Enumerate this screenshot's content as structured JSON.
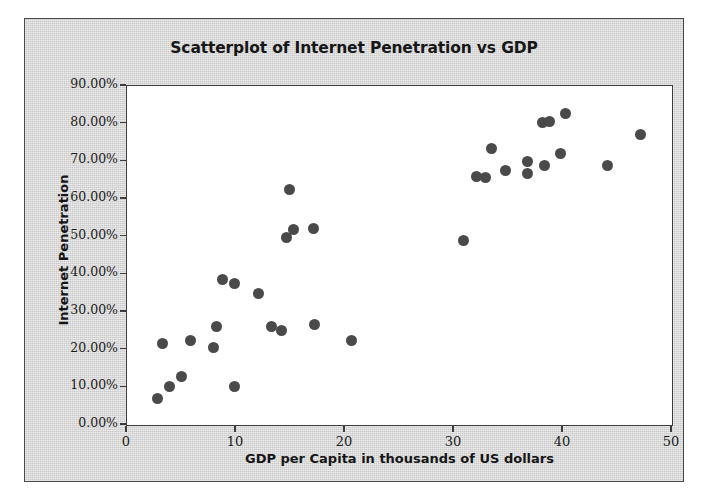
{
  "chart_data": {
    "type": "scatter",
    "title": "Scatterplot of Internet Penetration vs GDP",
    "xlabel": "GDP per Capita in thousands of US dollars",
    "ylabel": "Internet Penetration",
    "xlim": [
      0,
      50
    ],
    "ylim": [
      0,
      0.9
    ],
    "grid": false,
    "legend": null,
    "xticks": [
      0,
      10,
      20,
      30,
      40,
      50
    ],
    "xticklabels": [
      "0",
      "10",
      "20",
      "30",
      "40",
      "50"
    ],
    "yticks": [
      0.0,
      0.1,
      0.2,
      0.3,
      0.4,
      0.5,
      0.6,
      0.7,
      0.8,
      0.9
    ],
    "yticklabels": [
      "0.00%",
      "10.00%",
      "20.00%",
      "30.00%",
      "40.00%",
      "50.00%",
      "60.00%",
      "70.00%",
      "80.00%",
      "90.00%"
    ],
    "marker_color": "#4a4a4a",
    "marker_size": 11,
    "points": [
      {
        "x": 2.8,
        "y": 0.07
      },
      {
        "x": 3.9,
        "y": 0.102
      },
      {
        "x": 3.3,
        "y": 0.216
      },
      {
        "x": 5.0,
        "y": 0.128
      },
      {
        "x": 5.8,
        "y": 0.225
      },
      {
        "x": 7.9,
        "y": 0.205
      },
      {
        "x": 8.2,
        "y": 0.262
      },
      {
        "x": 8.8,
        "y": 0.385
      },
      {
        "x": 9.9,
        "y": 0.102
      },
      {
        "x": 9.9,
        "y": 0.375
      },
      {
        "x": 12.1,
        "y": 0.348
      },
      {
        "x": 13.3,
        "y": 0.262
      },
      {
        "x": 14.2,
        "y": 0.252
      },
      {
        "x": 14.6,
        "y": 0.498
      },
      {
        "x": 15.3,
        "y": 0.519
      },
      {
        "x": 14.9,
        "y": 0.625
      },
      {
        "x": 17.2,
        "y": 0.268
      },
      {
        "x": 17.1,
        "y": 0.521
      },
      {
        "x": 20.6,
        "y": 0.225
      },
      {
        "x": 30.9,
        "y": 0.489
      },
      {
        "x": 32.1,
        "y": 0.66
      },
      {
        "x": 32.9,
        "y": 0.657
      },
      {
        "x": 34.7,
        "y": 0.675
      },
      {
        "x": 33.4,
        "y": 0.735
      },
      {
        "x": 36.7,
        "y": 0.7
      },
      {
        "x": 36.7,
        "y": 0.668
      },
      {
        "x": 38.3,
        "y": 0.69
      },
      {
        "x": 38.1,
        "y": 0.802
      },
      {
        "x": 38.8,
        "y": 0.805
      },
      {
        "x": 40.2,
        "y": 0.828
      },
      {
        "x": 39.8,
        "y": 0.722
      },
      {
        "x": 44.1,
        "y": 0.688
      },
      {
        "x": 47.1,
        "y": 0.77
      }
    ]
  },
  "figure": {
    "background_color": "#d9d9d9",
    "plot_background_color": "#ffffff",
    "border_color": "#4a4a4a"
  }
}
